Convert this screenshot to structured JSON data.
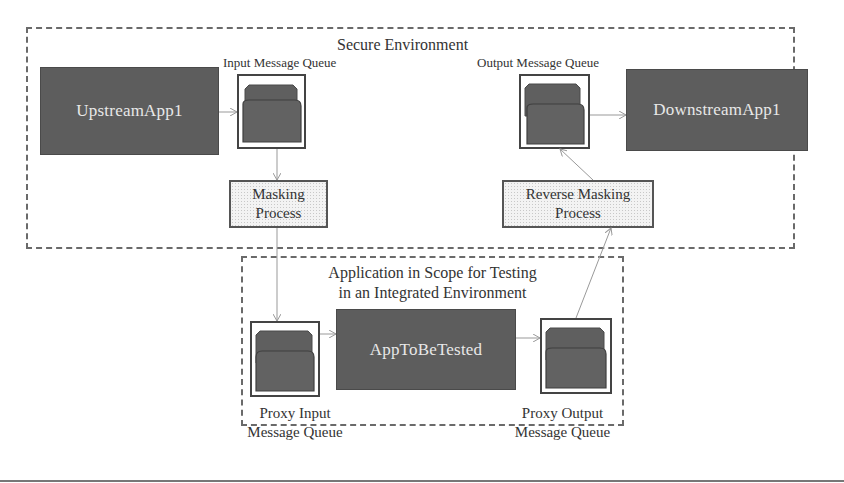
{
  "secure_environment": {
    "title": "Secure Environment",
    "input_queue_label": "Input Message Queue",
    "output_queue_label": "Output Message Queue",
    "upstream_app": "UpstreamApp1",
    "downstream_app": "DownstreamApp1",
    "masking_process": [
      "Masking",
      "Process"
    ],
    "reverse_masking_process": [
      "Reverse Masking",
      "Process"
    ]
  },
  "testing_environment": {
    "title": [
      "Application in Scope for Testing",
      "in an Integrated Environment"
    ],
    "app_under_test": "AppToBeTested",
    "proxy_input_queue_label": [
      "Proxy Input",
      "Message Queue"
    ],
    "proxy_output_queue_label": [
      "Proxy Output",
      "Message Queue"
    ]
  },
  "colors": {
    "app_fill": "#5d5d5d",
    "dash_border": "#6a6a6a",
    "process_fill": "#f3f3f3"
  }
}
